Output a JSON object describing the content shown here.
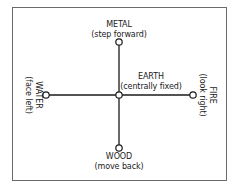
{
  "diagram": {
    "nodes": {
      "metal": {
        "title": "METAL",
        "subtitle": "(step forward)"
      },
      "earth": {
        "title": "EARTH",
        "subtitle": "(centrally fixed)"
      },
      "wood": {
        "title": "WOOD",
        "subtitle": "(move back)"
      },
      "water": {
        "title": "WATER",
        "subtitle": "(face left)"
      },
      "fire": {
        "title": "FIRE",
        "subtitle": "(look right)"
      }
    },
    "edges": [
      {
        "from": "earth",
        "to": "metal"
      },
      {
        "from": "earth",
        "to": "wood"
      },
      {
        "from": "earth",
        "to": "water"
      },
      {
        "from": "earth",
        "to": "fire"
      }
    ],
    "colors": {
      "line": "#1a1a1a",
      "node_fill": "#ffffff",
      "frame": "#6a6a6a"
    }
  }
}
